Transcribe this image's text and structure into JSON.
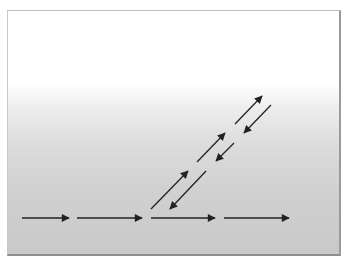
{
  "diagram": {
    "background": {
      "gradient_top": "#ffffff",
      "gradient_bottom": "#c9c9c9"
    },
    "arrow_color": "#222222",
    "horizontal_arrows": [
      {
        "x1": 22,
        "y1": 218,
        "x2": 69,
        "y2": 218
      },
      {
        "x1": 77,
        "y1": 218,
        "x2": 142,
        "y2": 218
      },
      {
        "x1": 151,
        "y1": 218,
        "x2": 215,
        "y2": 218
      },
      {
        "x1": 224,
        "y1": 218,
        "x2": 289,
        "y2": 218
      }
    ],
    "diagonal_up_arrows": [
      {
        "x1": 151,
        "y1": 209,
        "x2": 188,
        "y2": 171
      },
      {
        "x1": 197,
        "y1": 162,
        "x2": 225,
        "y2": 133
      },
      {
        "x1": 235,
        "y1": 124,
        "x2": 262,
        "y2": 96
      }
    ],
    "diagonal_down_arrows": [
      {
        "x1": 206,
        "y1": 171,
        "x2": 170,
        "y2": 209
      },
      {
        "x1": 234,
        "y1": 143,
        "x2": 216,
        "y2": 161
      },
      {
        "x1": 271,
        "y1": 105,
        "x2": 244,
        "y2": 133
      }
    ]
  }
}
